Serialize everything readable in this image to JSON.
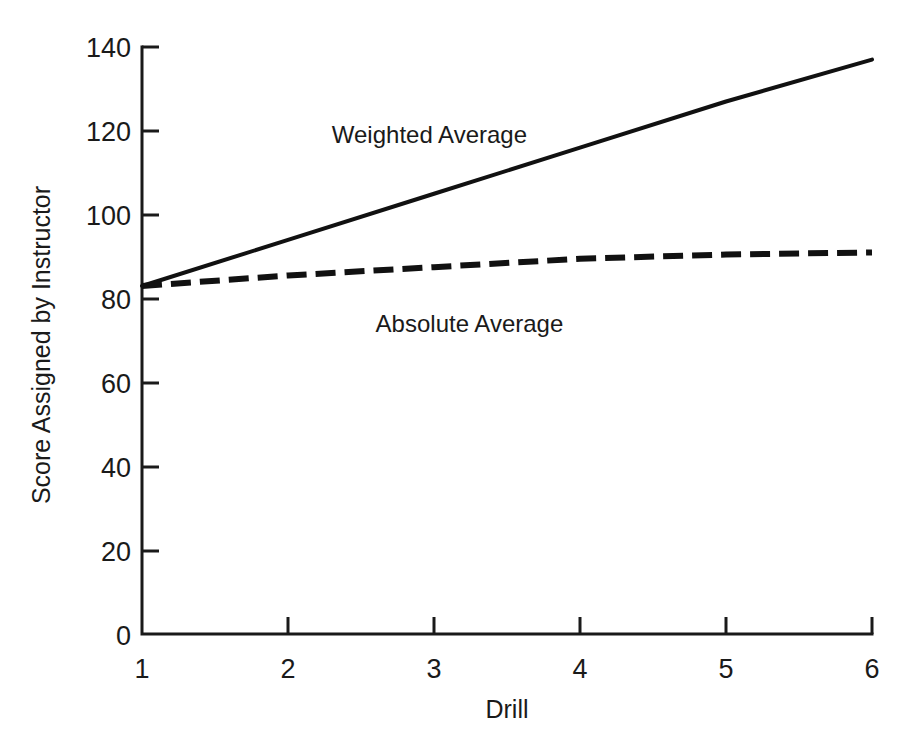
{
  "chart_data": {
    "type": "line",
    "title": "",
    "xlabel": "Drill",
    "ylabel": "Score Assigned by Instructor",
    "x": [
      1,
      2,
      3,
      4,
      5,
      6
    ],
    "xlim": [
      1,
      6
    ],
    "ylim": [
      0,
      140
    ],
    "xticks": [
      "1",
      "2",
      "3",
      "4",
      "5",
      "6"
    ],
    "yticks": [
      "0",
      "20",
      "40",
      "60",
      "80",
      "100",
      "120",
      "140"
    ],
    "ytick_values": [
      0,
      20,
      40,
      60,
      80,
      100,
      120,
      140
    ],
    "grid": false,
    "legend_position": "inline-annotation",
    "series": [
      {
        "name": "Weighted Average",
        "style": "solid",
        "values": [
          83,
          94,
          105,
          116,
          127,
          137
        ],
        "label_x": 2.3,
        "label_y": 117
      },
      {
        "name": "Absolute Average",
        "style": "dashed",
        "values": [
          83,
          85.5,
          87.5,
          89.5,
          90.5,
          91
        ],
        "label_x": 2.6,
        "label_y": 72
      }
    ],
    "annotations": [
      {
        "text": "Weighted Average"
      },
      {
        "text": "Absolute Average"
      }
    ]
  },
  "colors": {
    "ink": "#1a1a1a",
    "line": "#111111",
    "background": "#ffffff"
  }
}
